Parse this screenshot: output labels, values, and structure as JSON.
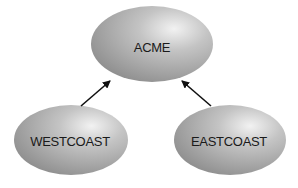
{
  "diagram": {
    "nodes": [
      {
        "id": "acme",
        "label": "ACME",
        "cx": 152,
        "cy": 44,
        "rx": 61,
        "ry": 38
      },
      {
        "id": "westcoast",
        "label": "WESTCOAST",
        "cx": 71,
        "cy": 140,
        "rx": 57,
        "ry": 35
      },
      {
        "id": "eastcoast",
        "label": "EASTCOAST",
        "cx": 230,
        "cy": 140,
        "rx": 56,
        "ry": 35
      }
    ],
    "edges": [
      {
        "from": "westcoast",
        "to": "acme"
      },
      {
        "from": "eastcoast",
        "to": "acme"
      }
    ],
    "colors": {
      "node_light": "#d8d8d8",
      "node_dark": "#8a8a8a",
      "arrow": "#111111",
      "text": "#1a1a1a"
    }
  }
}
